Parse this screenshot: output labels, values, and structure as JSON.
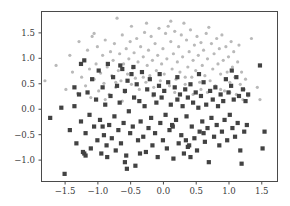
{
  "figure": {
    "background_color": "#ffffff",
    "width": 290,
    "height": 206
  },
  "axes": {
    "frame_color": "#4a4a4a",
    "tick_label_color": "#3b3b3b",
    "left": 41,
    "right": 277,
    "top": 11,
    "bottom": 181
  },
  "chart_data": {
    "type": "scatter",
    "title": "",
    "subtitle": "",
    "xlabel": "",
    "ylabel": "",
    "grid": false,
    "legend": null,
    "legend_position": "none",
    "xlim": [
      -1.86,
      1.74
    ],
    "ylim": [
      -1.42,
      1.92
    ],
    "xticks": [
      -1.5,
      -1.0,
      -0.5,
      0.0,
      0.5,
      1.0,
      1.5
    ],
    "xticklabels": [
      "-1.5",
      "-1.0",
      "-0.5",
      "0.0",
      "0.5",
      "1.0",
      "1.5"
    ],
    "yticks": [
      1.5,
      1.0,
      0.5,
      0.0,
      -0.5,
      -1.0
    ],
    "yticklabels": [
      "1.5",
      "1.0",
      "0.5",
      "0.0",
      "-0.5",
      "-1.0"
    ],
    "series": [
      {
        "name": "class-0",
        "marker": "circle",
        "color": "#b9b9b9",
        "size": 3.2,
        "points": [
          [
            -1.8,
            0.55
          ],
          [
            -1.63,
            0.85
          ],
          [
            -1.42,
            1.05
          ],
          [
            -1.38,
            0.72
          ],
          [
            -1.3,
            0.3
          ],
          [
            -1.28,
            1.32
          ],
          [
            -1.24,
            0.62
          ],
          [
            -1.2,
            0.95
          ],
          [
            -1.18,
            0.45
          ],
          [
            -1.15,
            1.15
          ],
          [
            -1.12,
            0.78
          ],
          [
            -1.1,
            0.22
          ],
          [
            -1.08,
            1.42
          ],
          [
            -1.05,
            0.58
          ],
          [
            -1.02,
            0.88
          ],
          [
            -1.0,
            1.22
          ],
          [
            -0.98,
            0.35
          ],
          [
            -0.95,
            0.7
          ],
          [
            -0.92,
            1.05
          ],
          [
            -0.9,
            0.5
          ],
          [
            -0.88,
            1.35
          ],
          [
            -0.85,
            0.82
          ],
          [
            -0.82,
            0.28
          ],
          [
            -0.8,
            1.12
          ],
          [
            -0.78,
            0.65
          ],
          [
            -0.76,
            0.95
          ],
          [
            -0.74,
            1.28
          ],
          [
            -0.72,
            0.42
          ],
          [
            -0.7,
            1.78
          ],
          [
            -0.68,
            0.75
          ],
          [
            -0.66,
            1.08
          ],
          [
            -0.64,
            0.55
          ],
          [
            -0.62,
            1.45
          ],
          [
            -0.6,
            0.88
          ],
          [
            -0.58,
            0.32
          ],
          [
            -0.56,
            1.18
          ],
          [
            -0.54,
            0.68
          ],
          [
            -0.52,
            0.98
          ],
          [
            -0.5,
            1.32
          ],
          [
            -0.48,
            0.48
          ],
          [
            -0.46,
            0.8
          ],
          [
            -0.44,
            1.1
          ],
          [
            -0.42,
            0.6
          ],
          [
            -0.4,
            1.38
          ],
          [
            -0.38,
            0.92
          ],
          [
            -0.36,
            0.38
          ],
          [
            -0.34,
            1.22
          ],
          [
            -0.32,
            0.72
          ],
          [
            -0.3,
            1.02
          ],
          [
            -0.28,
            1.5
          ],
          [
            -0.26,
            0.52
          ],
          [
            -0.24,
            0.85
          ],
          [
            -0.22,
            1.15
          ],
          [
            -0.2,
            0.65
          ],
          [
            -0.18,
            1.42
          ],
          [
            -0.16,
            0.95
          ],
          [
            -0.14,
            0.42
          ],
          [
            -0.12,
            1.28
          ],
          [
            -0.1,
            0.75
          ],
          [
            -0.08,
            1.05
          ],
          [
            -0.06,
            1.58
          ],
          [
            -0.04,
            0.55
          ],
          [
            -0.02,
            0.88
          ],
          [
            0.0,
            1.18
          ],
          [
            0.02,
            0.68
          ],
          [
            0.04,
            1.48
          ],
          [
            0.06,
            0.98
          ],
          [
            0.08,
            1.62
          ],
          [
            0.1,
            0.45
          ],
          [
            0.12,
            1.32
          ],
          [
            0.14,
            0.78
          ],
          [
            0.16,
            1.08
          ],
          [
            0.18,
            1.52
          ],
          [
            0.2,
            0.58
          ],
          [
            0.22,
            0.92
          ],
          [
            0.24,
            1.22
          ],
          [
            0.26,
            0.72
          ],
          [
            0.28,
            1.45
          ],
          [
            0.3,
            1.02
          ],
          [
            0.32,
            1.68
          ],
          [
            0.34,
            0.48
          ],
          [
            0.36,
            1.35
          ],
          [
            0.38,
            0.82
          ],
          [
            0.4,
            1.12
          ],
          [
            0.42,
            1.55
          ],
          [
            0.44,
            0.62
          ],
          [
            0.46,
            0.95
          ],
          [
            0.48,
            1.25
          ],
          [
            0.5,
            0.75
          ],
          [
            0.52,
            1.42
          ],
          [
            0.54,
            1.05
          ],
          [
            0.56,
            0.52
          ],
          [
            0.58,
            1.3
          ],
          [
            0.6,
            0.85
          ],
          [
            0.62,
            1.15
          ],
          [
            0.64,
            0.65
          ],
          [
            0.66,
            1.48
          ],
          [
            0.68,
            0.98
          ],
          [
            0.7,
            1.6
          ],
          [
            0.72,
            0.55
          ],
          [
            0.74,
            1.28
          ],
          [
            0.76,
            0.78
          ],
          [
            0.78,
            1.08
          ],
          [
            0.8,
            0.45
          ],
          [
            0.82,
            1.38
          ],
          [
            0.84,
            0.88
          ],
          [
            0.86,
            1.18
          ],
          [
            0.88,
            0.68
          ],
          [
            0.9,
            1.45
          ],
          [
            0.92,
            0.95
          ],
          [
            0.94,
            0.35
          ],
          [
            0.96,
            1.22
          ],
          [
            0.98,
            0.72
          ],
          [
            1.0,
            1.02
          ],
          [
            1.02,
            0.52
          ],
          [
            1.04,
            1.32
          ],
          [
            1.06,
            0.82
          ],
          [
            1.08,
            1.12
          ],
          [
            1.1,
            0.62
          ],
          [
            1.12,
            0.28
          ],
          [
            1.14,
            0.92
          ],
          [
            1.16,
            1.25
          ],
          [
            1.18,
            0.48
          ],
          [
            1.2,
            0.72
          ],
          [
            1.22,
            0.18
          ],
          [
            1.24,
            0.38
          ],
          [
            1.26,
            0.58
          ],
          [
            1.3,
            0.25
          ],
          [
            1.35,
            1.38
          ],
          [
            1.44,
            0.42
          ],
          [
            1.48,
            0.18
          ],
          [
            -1.48,
            0.38
          ],
          [
            -0.62,
            0.15
          ],
          [
            -0.3,
            0.62
          ],
          [
            0.18,
            0.32
          ],
          [
            0.58,
            0.38
          ],
          [
            -0.88,
            0.18
          ],
          [
            -1.05,
            1.48
          ],
          [
            0.34,
            0.62
          ],
          [
            0.88,
            0.38
          ],
          [
            -0.15,
            0.25
          ],
          [
            -0.48,
            1.62
          ],
          [
            0.12,
            1.72
          ],
          [
            0.46,
            0.28
          ],
          [
            -0.72,
            0.52
          ],
          [
            1.02,
            0.32
          ],
          [
            -0.25,
            1.68
          ],
          [
            0.68,
            0.32
          ]
        ]
      },
      {
        "name": "class-1",
        "marker": "square",
        "color": "#424242",
        "size": 4.2,
        "points": [
          [
            -1.72,
            -0.18
          ],
          [
            -1.55,
            0.02
          ],
          [
            -1.5,
            -1.28
          ],
          [
            -1.42,
            -0.42
          ],
          [
            -1.35,
            0.05
          ],
          [
            -1.32,
            -0.68
          ],
          [
            -1.28,
            0.28
          ],
          [
            -1.25,
            -0.25
          ],
          [
            -1.22,
            -0.85
          ],
          [
            -1.2,
            0.95
          ],
          [
            -1.18,
            -0.48
          ],
          [
            -1.15,
            0.32
          ],
          [
            -1.12,
            -0.12
          ],
          [
            -1.1,
            -0.78
          ],
          [
            -1.08,
            0.58
          ],
          [
            -1.05,
            -0.35
          ],
          [
            -1.02,
            0.18
          ],
          [
            -1.0,
            -0.62
          ],
          [
            -0.98,
            0.75
          ],
          [
            -0.96,
            -0.22
          ],
          [
            -0.94,
            -0.88
          ],
          [
            -0.92,
            0.42
          ],
          [
            -0.9,
            -0.52
          ],
          [
            -0.88,
            0.08
          ],
          [
            -0.86,
            -0.72
          ],
          [
            -0.84,
            0.88
          ],
          [
            -0.82,
            -0.32
          ],
          [
            -0.8,
            0.25
          ],
          [
            -0.78,
            -0.58
          ],
          [
            -0.76,
            0.62
          ],
          [
            -0.74,
            -0.15
          ],
          [
            -0.72,
            -0.82
          ],
          [
            -0.7,
            0.45
          ],
          [
            -0.68,
            -0.42
          ],
          [
            -0.66,
            0.12
          ],
          [
            -0.64,
            -0.68
          ],
          [
            -0.62,
            0.78
          ],
          [
            -0.6,
            -0.28
          ],
          [
            -0.58,
            0.35
          ],
          [
            -0.56,
            -0.92
          ],
          [
            -0.54,
            0.55
          ],
          [
            -0.52,
            -0.05
          ],
          [
            -0.5,
            -0.48
          ],
          [
            -0.48,
            0.68
          ],
          [
            -0.46,
            -0.35
          ],
          [
            -0.44,
            0.22
          ],
          [
            -0.42,
            -1.12
          ],
          [
            -0.4,
            0.48
          ],
          [
            -0.38,
            -0.62
          ],
          [
            -0.36,
            0.15
          ],
          [
            -0.34,
            -0.25
          ],
          [
            -0.32,
            0.72
          ],
          [
            -0.3,
            -0.55
          ],
          [
            -0.28,
            0.05
          ],
          [
            -0.26,
            -0.85
          ],
          [
            -0.24,
            0.38
          ],
          [
            -0.22,
            -0.38
          ],
          [
            -0.2,
            0.58
          ],
          [
            -0.18,
            -0.18
          ],
          [
            -0.16,
            -0.72
          ],
          [
            -0.14,
            0.28
          ],
          [
            -0.12,
            -0.48
          ],
          [
            -0.1,
            0.12
          ],
          [
            -0.08,
            -0.95
          ],
          [
            -0.06,
            0.45
          ],
          [
            -0.04,
            -0.28
          ],
          [
            -0.02,
            0.22
          ],
          [
            0.0,
            -0.62
          ],
          [
            0.02,
            0.35
          ],
          [
            0.04,
            -0.12
          ],
          [
            0.06,
            -0.78
          ],
          [
            0.08,
            0.52
          ],
          [
            0.1,
            -0.42
          ],
          [
            0.12,
            0.08
          ],
          [
            0.14,
            -0.32
          ],
          [
            0.16,
            -0.98
          ],
          [
            0.18,
            0.42
          ],
          [
            0.2,
            -0.22
          ],
          [
            0.22,
            0.18
          ],
          [
            0.24,
            -0.68
          ],
          [
            0.26,
            0.28
          ],
          [
            0.28,
            -0.52
          ],
          [
            0.3,
            0.05
          ],
          [
            0.32,
            -0.88
          ],
          [
            0.34,
            0.38
          ],
          [
            0.36,
            -0.15
          ],
          [
            0.38,
            0.22
          ],
          [
            0.4,
            -0.72
          ],
          [
            0.42,
            0.48
          ],
          [
            0.44,
            -0.35
          ],
          [
            0.46,
            0.12
          ],
          [
            0.48,
            -0.58
          ],
          [
            0.5,
            0.32
          ],
          [
            0.52,
            -0.82
          ],
          [
            0.54,
            0.02
          ],
          [
            0.56,
            -0.45
          ],
          [
            0.58,
            0.25
          ],
          [
            0.6,
            -0.25
          ],
          [
            0.62,
            0.52
          ],
          [
            0.64,
            -0.65
          ],
          [
            0.66,
            0.08
          ],
          [
            0.68,
            -0.38
          ],
          [
            0.7,
            -1.05
          ],
          [
            0.72,
            0.35
          ],
          [
            0.74,
            -0.18
          ],
          [
            0.76,
            0.18
          ],
          [
            0.78,
            -0.55
          ],
          [
            0.8,
            0.42
          ],
          [
            0.82,
            -0.32
          ],
          [
            0.84,
            0.05
          ],
          [
            0.86,
            -0.72
          ],
          [
            0.88,
            0.28
          ],
          [
            0.9,
            -0.45
          ],
          [
            0.92,
            0.15
          ],
          [
            0.94,
            -0.22
          ],
          [
            0.96,
            0.58
          ],
          [
            0.98,
            -0.62
          ],
          [
            1.0,
            0.32
          ],
          [
            1.02,
            -0.12
          ],
          [
            1.04,
            0.45
          ],
          [
            1.06,
            -0.38
          ],
          [
            1.08,
            0.18
          ],
          [
            1.1,
            -0.55
          ],
          [
            1.12,
            0.62
          ],
          [
            1.14,
            -0.28
          ],
          [
            1.16,
            0.25
          ],
          [
            1.18,
            -0.82
          ],
          [
            1.2,
            -1.08
          ],
          [
            1.22,
            0.38
          ],
          [
            1.24,
            -0.45
          ],
          [
            1.26,
            0.15
          ],
          [
            1.28,
            -0.32
          ],
          [
            1.3,
            0.28
          ],
          [
            1.48,
            0.85
          ],
          [
            1.52,
            -0.78
          ],
          [
            1.55,
            -0.45
          ],
          [
            -1.2,
            -0.88
          ],
          [
            -1.18,
            -0.92
          ],
          [
            -1.25,
            0.88
          ],
          [
            -0.58,
            -1.05
          ],
          [
            -0.55,
            -1.18
          ],
          [
            -0.85,
            -0.95
          ],
          [
            -0.35,
            -0.88
          ],
          [
            0.35,
            -0.62
          ],
          [
            0.38,
            -0.75
          ],
          [
            0.42,
            -0.95
          ],
          [
            -0.65,
            0.85
          ],
          [
            -0.45,
            0.82
          ],
          [
            0.22,
            0.62
          ],
          [
            0.55,
            0.68
          ],
          [
            1.05,
            0.75
          ],
          [
            -0.05,
            0.68
          ],
          [
            -0.92,
            -0.35
          ],
          [
            0.15,
            -0.35
          ],
          [
            0.62,
            -0.48
          ],
          [
            -1.35,
            0.42
          ]
        ]
      }
    ]
  }
}
